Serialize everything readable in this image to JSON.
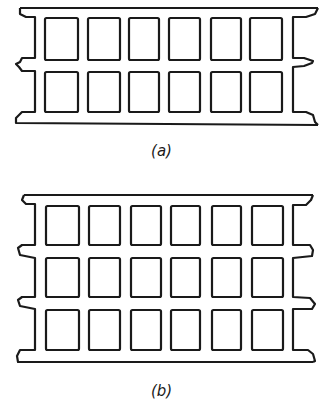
{
  "figures": [
    {
      "id": "a",
      "caption": "(a)",
      "rows": 2,
      "columns": 6,
      "description": "Cellular slab section with two rows of rectangular voids"
    },
    {
      "id": "b",
      "caption": "(b)",
      "rows": 3,
      "columns": 6,
      "description": "Cellular slab section with three rows of rectangular voids"
    }
  ],
  "colors": {
    "stroke": "#1a1a1a",
    "background": "#ffffff"
  }
}
